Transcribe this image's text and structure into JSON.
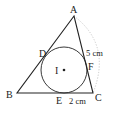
{
  "diagram": {
    "type": "geometry",
    "colors": {
      "stroke": "#222222",
      "arc": "#bbbbbb",
      "background": "#ffffff"
    },
    "points": {
      "A": {
        "label": "A",
        "x": 74,
        "y": 16
      },
      "B": {
        "label": "B",
        "x": 17,
        "y": 93
      },
      "C": {
        "label": "C",
        "x": 93,
        "y": 93
      },
      "D": {
        "label": "D",
        "x": 46,
        "y": 52
      },
      "E": {
        "label": "E",
        "x": 70,
        "y": 93
      },
      "F": {
        "label": "F",
        "x": 89,
        "y": 66
      },
      "I": {
        "label": "I",
        "x": 64,
        "y": 70
      }
    },
    "incircle": {
      "cx": 64,
      "cy": 70,
      "r": 23
    },
    "measurements": {
      "AF": "5 cm",
      "EC": "2 cm"
    }
  }
}
